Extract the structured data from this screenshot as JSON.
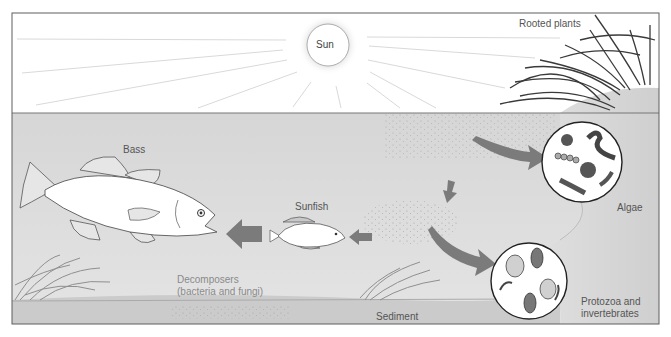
{
  "diagram": {
    "colors": {
      "sky": "#ffffff",
      "water": "#dcdcdc",
      "sediment": "#c9c9c9",
      "bank": "#d2d2d2",
      "arrow": "#7a7a7a",
      "border": "#6a6a6a",
      "sun_glow": "#e6e6e6"
    },
    "labels": {
      "sun": "Sun",
      "rooted_plants": "Rooted plants",
      "bass": "Bass",
      "sunfish": "Sunfish",
      "algae": "Algae",
      "decomposers_line1": "Decomposers",
      "decomposers_line2": "(bacteria and fungi)",
      "sediment": "Sediment",
      "protozoa_line1": "Protozoa and",
      "protozoa_line2": "invertebrates"
    },
    "nodes": [
      {
        "id": "sun",
        "label": "Sun"
      },
      {
        "id": "rooted_plants",
        "label": "Rooted plants"
      },
      {
        "id": "algae",
        "label": "Algae"
      },
      {
        "id": "protozoa",
        "label": "Protozoa and invertebrates"
      },
      {
        "id": "sunfish",
        "label": "Sunfish"
      },
      {
        "id": "bass",
        "label": "Bass"
      },
      {
        "id": "decomposers",
        "label": "Decomposers (bacteria and fungi)"
      },
      {
        "id": "sediment",
        "label": "Sediment"
      }
    ],
    "edges": [
      {
        "from": "detritus",
        "to": "algae"
      },
      {
        "from": "detritus",
        "to": "protozoa"
      },
      {
        "from": "detritus_upper",
        "to": "detritus_lower"
      },
      {
        "from": "detritus_lower",
        "to": "sunfish"
      },
      {
        "from": "sunfish",
        "to": "bass"
      }
    ]
  }
}
